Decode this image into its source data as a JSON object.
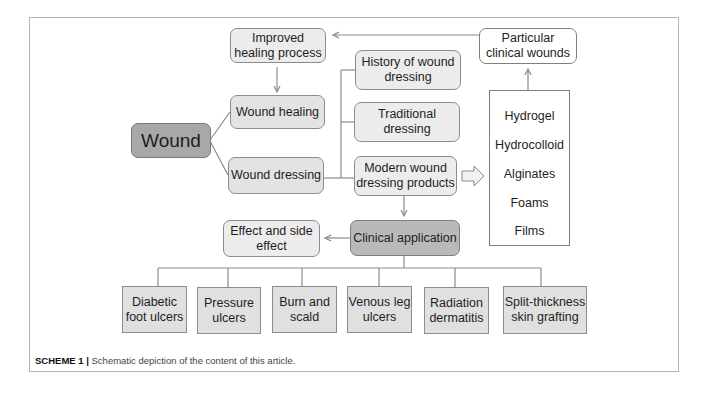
{
  "diagram": {
    "root": "Wound",
    "nodes": {
      "improved_healing": "Improved healing process",
      "improved_healing_l1": "Improved",
      "improved_healing_l2": "healing process",
      "wound_healing": "Wound healing",
      "wound": "Wound",
      "wound_dressing": "Wound dressing",
      "history_l1": "History of wound",
      "history_l2": "dressing",
      "traditional_l1": "Traditional",
      "traditional_l2": "dressing",
      "modern_l1": "Modern wound",
      "modern_l2": "dressing products",
      "particular_l1": "Particular",
      "particular_l2": "clinical wounds",
      "clinical_application": "Clinical application",
      "effect_l1": "Effect and side",
      "effect_l2": "effect"
    },
    "dressing_types": [
      "Hydrogel",
      "Hydrocolloid",
      "Alginates",
      "Foams",
      "Films"
    ],
    "applications": [
      {
        "l1": "Diabetic",
        "l2": "foot ulcers"
      },
      {
        "l1": "Pressure",
        "l2": "ulcers"
      },
      {
        "l1": "Burn and",
        "l2": "scald"
      },
      {
        "l1": "Venous leg",
        "l2": "ulcers"
      },
      {
        "l1": "Radiation",
        "l2": "dermatitis"
      },
      {
        "l1": "Split-thickness",
        "l2": "skin grafting"
      }
    ],
    "edges": [
      [
        "Wound",
        "Wound healing"
      ],
      [
        "Wound",
        "Wound dressing"
      ],
      [
        "Improved healing process",
        "Wound healing"
      ],
      [
        "Wound dressing",
        "History of wound dressing"
      ],
      [
        "Wound dressing",
        "Traditional dressing"
      ],
      [
        "Wound dressing",
        "Modern wound dressing products"
      ],
      [
        "Modern wound dressing products",
        "Dressing types"
      ],
      [
        "Dressing types",
        "Particular clinical wounds"
      ],
      [
        "Particular clinical wounds",
        "Improved healing process"
      ],
      [
        "Modern wound dressing products",
        "Clinical application"
      ],
      [
        "Clinical application",
        "Effect and side effect"
      ],
      [
        "Clinical application",
        "Diabetic foot ulcers"
      ],
      [
        "Clinical application",
        "Pressure ulcers"
      ],
      [
        "Clinical application",
        "Burn and scald"
      ],
      [
        "Clinical application",
        "Venous leg ulcers"
      ],
      [
        "Clinical application",
        "Radiation dermatitis"
      ],
      [
        "Clinical application",
        "Split-thickness skin grafting"
      ]
    ]
  },
  "caption": {
    "label": "SCHEME 1 |",
    "text": " Schematic depiction of the content of this article."
  },
  "colors": {
    "box_fill": "#e3e3e3",
    "root_fill": "#a8a8a8",
    "clinical_fill": "#b9b9b9",
    "line": "#8a8a8a"
  }
}
